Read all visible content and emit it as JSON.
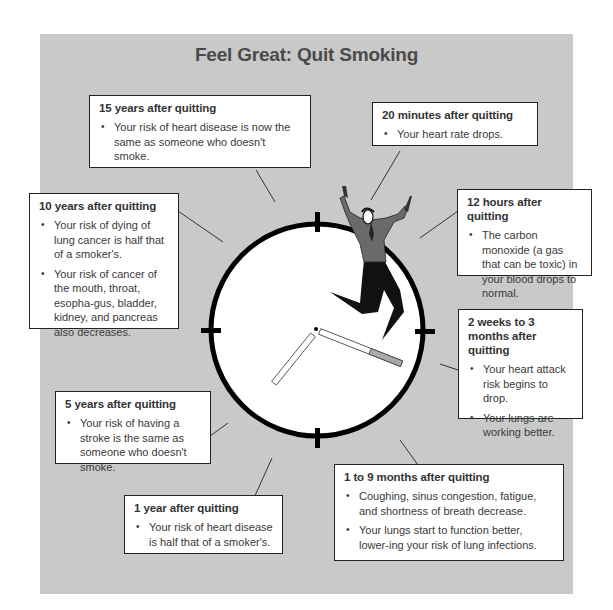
{
  "title": "Feel Great: Quit Smoking",
  "colors": {
    "panel_bg": "#c9c9c9",
    "box_border": "#222222",
    "clock_face": "#ffffff",
    "clock_ring": "#000000",
    "figure_shirt": "#6a6a6a",
    "figure_pants": "#111111"
  },
  "milestones": [
    {
      "id": "15-years",
      "heading": "15 years after quitting",
      "bullets": [
        "Your risk of heart disease is now the same as someone who doesn't smoke."
      ]
    },
    {
      "id": "20-minutes",
      "heading": "20 minutes after quitting",
      "bullets": [
        "Your heart rate drops."
      ]
    },
    {
      "id": "10-years",
      "heading": "10 years after quitting",
      "bullets": [
        "Your risk of dying of lung cancer is half that of a smoker's.",
        "Your risk of cancer of the mouth, throat, esopha-gus, bladder, kidney, and pancreas also decreases."
      ]
    },
    {
      "id": "12-hours",
      "heading": "12 hours after quitting",
      "bullets": [
        "The carbon monoxide (a gas that can be toxic) in your blood drops to normal."
      ]
    },
    {
      "id": "2-weeks-3-months",
      "heading": "2 weeks to 3 months after quitting",
      "bullets": [
        "Your heart attack risk begins to drop.",
        "Your lungs are working better."
      ]
    },
    {
      "id": "5-years",
      "heading": "5 years after quitting",
      "bullets": [
        "Your risk of having a stroke is the same as someone who doesn't smoke."
      ]
    },
    {
      "id": "1-to-9-months",
      "heading": "1 to 9 months after quitting",
      "bullets": [
        "Coughing, sinus congestion, fatigue, and shortness of breath decrease.",
        "Your lungs start to function better, lower-ing your risk of lung infections."
      ]
    },
    {
      "id": "1-year",
      "heading": "1 year after quitting",
      "bullets": [
        "Your risk of heart disease is half that of a smoker's."
      ]
    }
  ],
  "clock": {
    "icon": "clock-icon",
    "figure_icon": "jumping-person-icon"
  }
}
